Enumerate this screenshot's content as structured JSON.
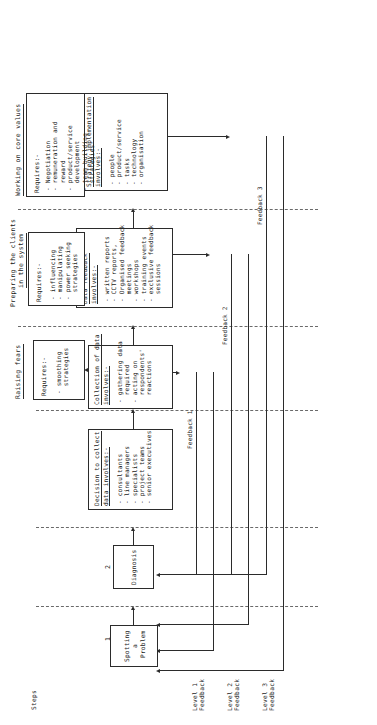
{
  "diagram": {
    "axis_label": "Steps",
    "step_numbers": [
      "1",
      "2",
      "3",
      "4",
      "5",
      "6"
    ],
    "phase_headers": [
      {
        "line1": "Raising fears",
        "line2": ""
      },
      {
        "line1": "Preparing the clients",
        "line2": "in the system"
      },
      {
        "line1": "Working on core values",
        "line2": ""
      }
    ],
    "boxes": [
      {
        "id": "spotting-a-problem",
        "title": "Spotting",
        "title2": "a",
        "title3": "Problem",
        "bullets": []
      },
      {
        "id": "diagnosis",
        "title": "Diagnosis",
        "bullets": []
      },
      {
        "id": "decision-to-collect-data",
        "title": "Decision to collect",
        "title2": "data involves:-",
        "bullets": [
          "- consultants",
          "- line managers",
          "- specialists",
          "- project teams",
          "- senior executives"
        ]
      },
      {
        "id": "collection-of-data",
        "title": "Collection of data",
        "title2": "involves:-",
        "bullets": [
          "- gathering data",
          "  required",
          "- acting on",
          "  respondents'",
          "  reactions"
        ]
      },
      {
        "id": "data-feedback",
        "title": "Data feedback",
        "title2": "involves:-",
        "bullets": [
          "- written reports",
          "- CCTV reports,",
          "- Organised feedback",
          "  meetings",
          "- workshops",
          "- training events",
          "- exclusive feedback",
          "  sessions"
        ]
      },
      {
        "id": "strategy-implementation",
        "title": "Strategy implementation",
        "title2": "involves:-",
        "bullets": [
          "- people",
          "- product/service",
          "- tasks",
          "- technology",
          "- organisation"
        ]
      },
      {
        "id": "requires-smoothing",
        "title": "Requires:-",
        "bullets": [
          "- smoothing",
          "  strategies"
        ]
      },
      {
        "id": "requires-influencing",
        "title": "Requires:-",
        "bullets": [
          "- influencing",
          "- manipulating",
          "- power seeking",
          "  strategies"
        ]
      },
      {
        "id": "requires-negotiation",
        "title": "Requires:-",
        "bullets": [
          "- Negotiation",
          "- remuneration and",
          "  reward",
          "- product/service",
          "  development",
          "- team building",
          "  strategies"
        ]
      }
    ],
    "feedback_arrows": [
      {
        "label": "Feedback 1"
      },
      {
        "label": "Feedback 2"
      },
      {
        "label": "Feedback 3"
      }
    ],
    "level_labels": [
      {
        "line1": "Level 1",
        "line2": "Feedback"
      },
      {
        "line1": "Level 2",
        "line2": "Feedback"
      },
      {
        "line1": "Level 3",
        "line2": "Feedback"
      }
    ]
  },
  "colors": {
    "ink": "#2b2b2b",
    "dashed": "#6a6a6a",
    "paper": "#ffffff"
  }
}
